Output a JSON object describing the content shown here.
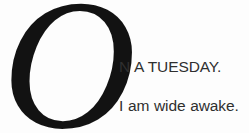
{
  "page": {
    "background_color": "#fdfdfd",
    "width": 249,
    "height": 133
  },
  "dropcap": {
    "letter": "O",
    "color": "#121212"
  },
  "body_text": {
    "color": "#2f2f2f",
    "lines": [
      "N A TUESDAY.",
      "I am wide awake."
    ]
  },
  "full_text": "ON A TUESDAY. I am wide awake."
}
